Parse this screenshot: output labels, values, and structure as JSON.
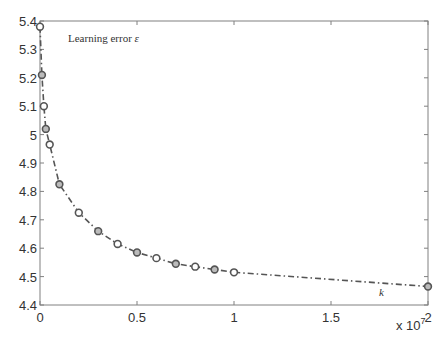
{
  "chart_data": {
    "type": "line",
    "title": "",
    "xlabel": "",
    "ylabel": "",
    "x_multiplier_label": "x 10",
    "x_multiplier_exp": "7",
    "xlim": [
      0,
      20000000
    ],
    "ylim": [
      4.4,
      5.4
    ],
    "grid": false,
    "legend": null,
    "xticks": [
      0,
      5000000,
      10000000,
      15000000,
      20000000
    ],
    "xtick_labels": [
      "0",
      "0.5",
      "1",
      "1.5",
      "2"
    ],
    "yticks": [
      4.4,
      4.5,
      4.6,
      4.7,
      4.8,
      4.9,
      5.0,
      5.1,
      5.2,
      5.3,
      5.4
    ],
    "ytick_labels": [
      "4.4",
      "4.5",
      "4.6",
      "4.7",
      "4.8",
      "4.9",
      "5",
      "5.1",
      "5.2",
      "5.3",
      "5.4"
    ],
    "annotations": [
      {
        "text": "Learning error ",
        "symbol": "ε",
        "position": "top-left"
      },
      {
        "text": "k",
        "position": "bottom-right near x=1.8e7"
      }
    ],
    "series": [
      {
        "name": "Learning error",
        "line_style": "dash-dot",
        "marker": "circle",
        "color": "#555555",
        "x": [
          0,
          100000,
          200000,
          300000,
          500000,
          1000000,
          2000000,
          3000000,
          4000000,
          5000000,
          6000000,
          7000000,
          8000000,
          9000000,
          10000000,
          20000000
        ],
        "y": [
          5.38,
          5.21,
          5.1,
          5.02,
          4.965,
          4.825,
          4.725,
          4.66,
          4.615,
          4.585,
          4.565,
          4.545,
          4.535,
          4.525,
          4.515,
          4.465
        ]
      }
    ]
  }
}
